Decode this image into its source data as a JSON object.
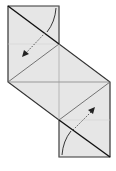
{
  "diagram": {
    "type": "origami-fold-diagram",
    "colors": {
      "paper": "#e6e6e6",
      "line": "#222222",
      "crease": "#555555",
      "arrow": "#444444",
      "background": "#ffffff"
    },
    "arrows": [
      {
        "name": "fold-arrow-upper",
        "direction": "down-left"
      },
      {
        "name": "fold-arrow-lower",
        "direction": "up-right"
      }
    ]
  }
}
